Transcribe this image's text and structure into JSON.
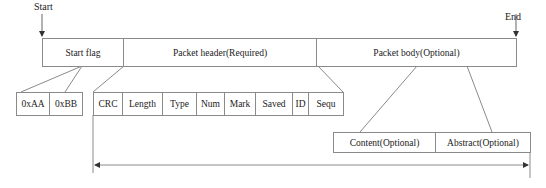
{
  "markers": {
    "start": "Start",
    "end": "End"
  },
  "main_row": [
    {
      "label": "Start flag",
      "x": 42,
      "w": 81
    },
    {
      "label": "Packet header(Required)",
      "x": 123,
      "w": 193
    },
    {
      "label": "Packet body(Optional)",
      "x": 316,
      "w": 200
    }
  ],
  "start_flag_fields": [
    {
      "label": "0xAA",
      "x": 16,
      "w": 33
    },
    {
      "label": "0xBB",
      "x": 49,
      "w": 33
    }
  ],
  "header_fields": [
    {
      "label": "CRC",
      "x": 93,
      "w": 29
    },
    {
      "label": "Length",
      "x": 122,
      "w": 40
    },
    {
      "label": "Type",
      "x": 162,
      "w": 34
    },
    {
      "label": "Num",
      "x": 196,
      "w": 28
    },
    {
      "label": "Mark",
      "x": 224,
      "w": 31
    },
    {
      "label": "Saved",
      "x": 255,
      "w": 37
    },
    {
      "label": "ID",
      "x": 292,
      "w": 16
    },
    {
      "label": "Sequ",
      "x": 308,
      "w": 35
    }
  ],
  "body_fields": [
    {
      "label": "Content(Optional)",
      "x": 333,
      "w": 102
    },
    {
      "label": "Abstract(Optional)",
      "x": 435,
      "w": 95
    }
  ],
  "colors": {
    "line": "#8a8a8a",
    "text": "#222222"
  }
}
